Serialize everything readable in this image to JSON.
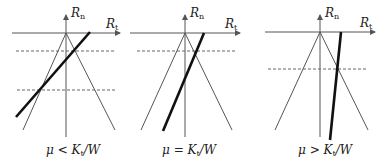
{
  "diagram": {
    "type": "friction-cone-comparison",
    "panels": [
      {
        "id": "left",
        "axis_labels": {
          "vertical": "R",
          "vertical_sub": "n",
          "horizontal": "R",
          "horizontal_sub": "t"
        },
        "caption": {
          "mu": "μ",
          "relation": "<",
          "k": "K",
          "k_sub": "t",
          "rest": "/W"
        },
        "dashed_lines": 2
      },
      {
        "id": "middle",
        "axis_labels": {
          "vertical": "R",
          "vertical_sub": "n",
          "horizontal": "R",
          "horizontal_sub": "t"
        },
        "caption": {
          "mu": "μ",
          "relation": "=",
          "k": "K",
          "k_sub": "t",
          "rest": "/W"
        },
        "dashed_lines": 1
      },
      {
        "id": "right",
        "axis_labels": {
          "vertical": "R",
          "vertical_sub": "n",
          "horizontal": "R",
          "horizontal_sub": "t"
        },
        "caption": {
          "mu": "μ",
          "relation": ">",
          "k": "K",
          "k_sub": "t",
          "rest": "/W"
        },
        "dashed_lines": 1
      }
    ],
    "colors": {
      "axis": "#555555",
      "cone": "#555555",
      "thick": "#111111",
      "dashed": "#666666"
    }
  }
}
